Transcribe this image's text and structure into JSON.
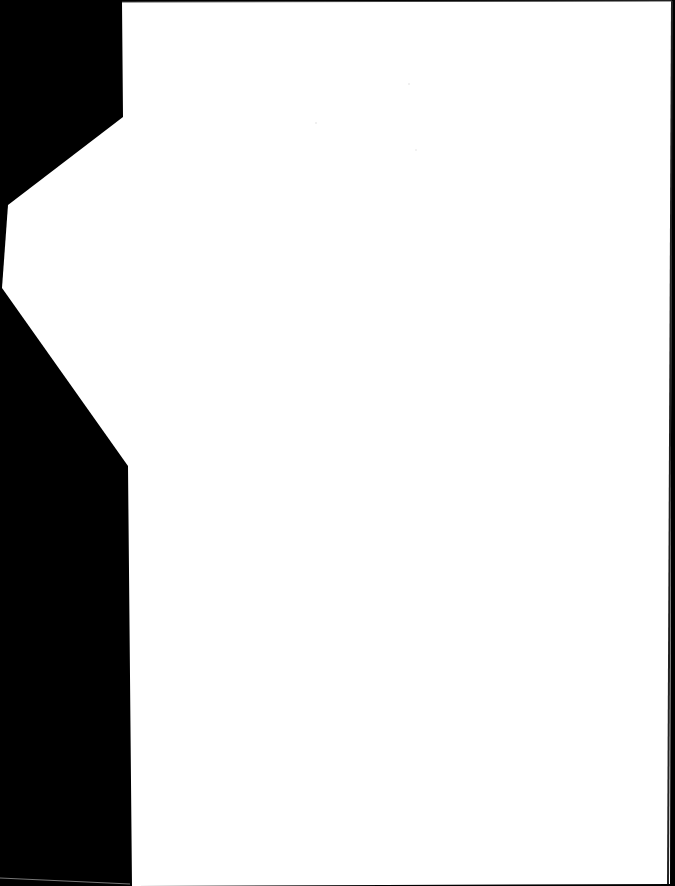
{
  "document": {
    "type": "scanned-page",
    "content": "",
    "background_color": "#000000",
    "page_color": "#ffffff",
    "flap_color": "#ffffff"
  }
}
